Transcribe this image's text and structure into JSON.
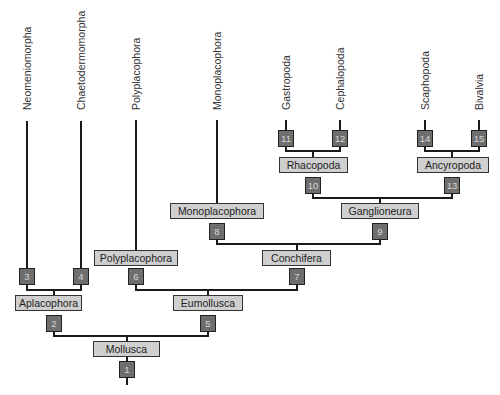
{
  "diagram": {
    "type": "phylogenetic-tree",
    "root": "Mollusca",
    "colors": {
      "line": "#1a1a1a",
      "clade_box_fill": "#cfcfcf",
      "node_box_fill": "#6e6e6e",
      "node_text": "#d8d8d8",
      "label_text": "#333333"
    },
    "leaves": [
      {
        "name": "Neomeniomorpha",
        "x": 27,
        "node": "3"
      },
      {
        "name": "Chaetodermomorpha",
        "x": 81,
        "node": "4"
      },
      {
        "name": "Polyplacophora",
        "x": 136,
        "node": "6"
      },
      {
        "name": "Monoplacophora",
        "x": 217,
        "node": "8"
      },
      {
        "name": "Gastropoda",
        "x": 286,
        "node": "11"
      },
      {
        "name": "Cephalopoda",
        "x": 340,
        "node": "12"
      },
      {
        "name": "Scaphopoda",
        "x": 425,
        "node": "14"
      },
      {
        "name": "Bivalvia",
        "x": 479,
        "node": "15"
      }
    ],
    "clades": [
      {
        "name": "Mollusca",
        "node": "1",
        "children": [
          "Aplacophora",
          "Eumollusca"
        ]
      },
      {
        "name": "Aplacophora",
        "node": "2",
        "children": [
          "Neomeniomorpha",
          "Chaetodermomorpha"
        ]
      },
      {
        "name": "Eumollusca",
        "node": "5",
        "children": [
          "Polyplacophora",
          "Conchifera"
        ]
      },
      {
        "name": "Polyplacophora",
        "node": "6",
        "children": []
      },
      {
        "name": "Conchifera",
        "node": "7",
        "children": [
          "Monoplacophora",
          "Ganglioneura"
        ]
      },
      {
        "name": "Monoplacophora",
        "node": "8",
        "children": []
      },
      {
        "name": "Ganglioneura",
        "node": "9",
        "children": [
          "Rhacopoda",
          "Ancyropoda"
        ]
      },
      {
        "name": "Rhacopoda",
        "node": "10",
        "children": [
          "Gastropoda",
          "Cephalopoda"
        ]
      },
      {
        "name": "Ancyropoda",
        "node": "13",
        "children": [
          "Scaphopoda",
          "Bivalvia"
        ]
      }
    ],
    "boxes": {
      "mollusca": "Mollusca",
      "aplacophora": "Aplacophora",
      "eumollusca": "Eumollusca",
      "polyplacophora": "Polyplacophora",
      "conchifera": "Conchifera",
      "monoplacophora": "Monoplacophora",
      "ganglioneura": "Ganglioneura",
      "rhacopoda": "Rhacopoda",
      "ancyropoda": "Ancyropoda"
    },
    "nodes": {
      "n1": "1",
      "n2": "2",
      "n3": "3",
      "n4": "4",
      "n5": "5",
      "n6": "6",
      "n7": "7",
      "n8": "8",
      "n9": "9",
      "n10": "10",
      "n11": "11",
      "n12": "12",
      "n13": "13",
      "n14": "14",
      "n15": "15"
    },
    "leaf_labels": {
      "neomeniomorpha": "Neomeniomorpha",
      "chaetodermomorpha": "Chaetodermomorpha",
      "polyplacophora": "Polyplacophora",
      "monoplacophora": "Monoplacophora",
      "gastropoda": "Gastropoda",
      "cephalopoda": "Cephalopoda",
      "scaphopoda": "Scaphopoda",
      "bivalvia": "Bivalvia"
    }
  }
}
